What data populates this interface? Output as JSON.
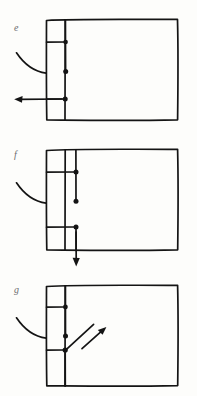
{
  "document": {
    "kind": "hand-drawn-diagram-sheet",
    "title": "",
    "background_color": "#fdfdfb",
    "ink_color": "#141414",
    "label_color": "#6d6d70",
    "panel_count": 3
  },
  "panels": [
    {
      "id": "panel-e",
      "label": "e",
      "label_position": {
        "x": 14,
        "y": 28
      },
      "frame": {
        "x": 46,
        "y": 19,
        "width": 132,
        "height": 101
      },
      "spine_x": 65,
      "brackets": [
        {
          "name": "upper-bracket",
          "y": 42,
          "x_from": 46,
          "x_to": 65,
          "dot": true
        },
        {
          "name": "lower-bracket",
          "y": 99,
          "x_from": 46,
          "x_to": 65,
          "dot": true
        }
      ],
      "stems": [
        {
          "name": "upper-stem",
          "from_y": 19,
          "to_y": 71,
          "dot_at_end": true
        }
      ],
      "leader_curve": {
        "name": "curved-leader",
        "from": {
          "x": 16,
          "y": 53
        },
        "to": {
          "x": 46,
          "y": 73
        }
      },
      "arrow": {
        "name": "left-arrow",
        "direction": "left",
        "from": {
          "x": 65,
          "y": 99
        },
        "to": {
          "x": 15,
          "y": 99
        }
      }
    },
    {
      "id": "panel-f",
      "label": "f",
      "label_position": {
        "x": 14,
        "y": 155
      },
      "frame": {
        "x": 46,
        "y": 149,
        "width": 132,
        "height": 101
      },
      "spine_x": 65,
      "brackets": [
        {
          "name": "upper-bracket",
          "y": 172,
          "x_from": 46,
          "x_to": 65,
          "dot": true
        },
        {
          "name": "lower-bracket",
          "y": 227,
          "x_from": 46,
          "x_to": 65,
          "dot": true
        }
      ],
      "stems": [
        {
          "name": "upper-stem",
          "from_y": 149,
          "to_y": 201,
          "dot_at_end": true
        },
        {
          "name": "lower-stem",
          "from_y": 227,
          "to_y": 250,
          "dot_at_end": false
        }
      ],
      "leader_curve": {
        "name": "curved-leader",
        "from": {
          "x": 16,
          "y": 183
        },
        "to": {
          "x": 46,
          "y": 203
        }
      },
      "arrow": {
        "name": "down-arrow",
        "direction": "down",
        "from": {
          "x": 76,
          "y": 232
        },
        "to": {
          "x": 76,
          "y": 266
        }
      }
    },
    {
      "id": "panel-g",
      "label": "g",
      "label_position": {
        "x": 14,
        "y": 290
      },
      "frame": {
        "x": 46,
        "y": 285,
        "width": 132,
        "height": 101
      },
      "spine_x": 65,
      "brackets": [
        {
          "name": "upper-bracket",
          "y": 307,
          "x_from": 46,
          "x_to": 65,
          "dot": true
        },
        {
          "name": "lower-bracket",
          "y": 350,
          "x_from": 46,
          "x_to": 65,
          "dot": true
        }
      ],
      "stems": [
        {
          "name": "upper-stem",
          "from_y": 285,
          "to_y": 336,
          "dot_at_end": true
        },
        {
          "name": "lower-stem",
          "from_y": 350,
          "to_y": 386,
          "dot_at_end": false
        }
      ],
      "leader_curve": {
        "name": "curved-leader",
        "from": {
          "x": 16,
          "y": 318
        },
        "to": {
          "x": 46,
          "y": 338
        }
      },
      "diagonal_line": {
        "name": "diagonal-stroke",
        "from": {
          "x": 65,
          "y": 350
        },
        "to": {
          "x": 93,
          "y": 325
        }
      },
      "arrow": {
        "name": "diagonal-up-right-arrow",
        "direction": "up-right",
        "from": {
          "x": 82,
          "y": 348
        },
        "to": {
          "x": 106,
          "y": 327
        }
      }
    }
  ]
}
